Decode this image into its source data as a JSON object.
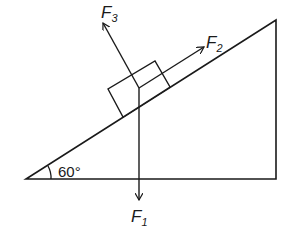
{
  "diagram": {
    "type": "inclined-plane-force-diagram",
    "angle_label": "60°",
    "forces": [
      {
        "name": "F",
        "sub": "1",
        "direction": "vertical-down"
      },
      {
        "name": "F",
        "sub": "2",
        "direction": "along-incline-up"
      },
      {
        "name": "F",
        "sub": "3",
        "direction": "perpendicular-to-incline"
      }
    ],
    "line_color": "#1a1a1a"
  }
}
